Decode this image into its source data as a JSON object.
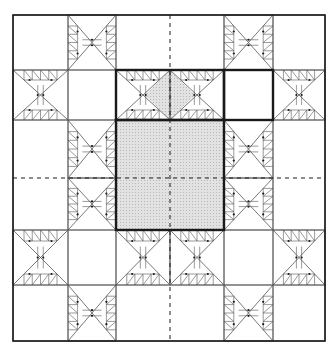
{
  "diagram": {
    "type": "quilt-block-layout",
    "colors": {
      "background": "#ffffff",
      "line": "#1a1a1a",
      "thin_line": "#555555",
      "shade": "#dcdcdc",
      "shade_dot": "#b8b8b8"
    },
    "outer_border": {
      "x0": 13,
      "y0": 15,
      "x1": 325,
      "y1": 341
    },
    "columns": [
      13,
      68,
      116,
      224,
      273,
      325
    ],
    "rows": [
      15,
      70,
      120,
      230,
      285,
      341
    ],
    "center_lines": {
      "x": 170,
      "y": 178,
      "style": "dashed"
    },
    "highlighted_regions": [
      {
        "name": "center-shaded-square",
        "x0": 116,
        "y0": 120,
        "x1": 224,
        "y1": 230,
        "shaded": true,
        "outline": "thick"
      },
      {
        "name": "top-feather-strip",
        "x0": 116,
        "y0": 70,
        "x1": 224,
        "y1": 120,
        "shaded_diamond": true,
        "outline": "thick"
      },
      {
        "name": "plain-center-square",
        "x0": 224,
        "y0": 70,
        "x1": 273,
        "y1": 120,
        "shaded": false,
        "outline": "thick"
      }
    ],
    "feather_units": [
      {
        "orient": "v",
        "x0": 68,
        "y0": 15,
        "x1": 116,
        "y1": 70
      },
      {
        "orient": "v",
        "x0": 224,
        "y0": 15,
        "x1": 273,
        "y1": 70
      },
      {
        "orient": "h",
        "x0": 13,
        "y0": 70,
        "x1": 68,
        "y1": 120
      },
      {
        "orient": "h",
        "x0": 116,
        "y0": 70,
        "x1": 170,
        "y1": 120
      },
      {
        "orient": "h",
        "x0": 170,
        "y0": 70,
        "x1": 224,
        "y1": 120
      },
      {
        "orient": "h",
        "x0": 273,
        "y0": 70,
        "x1": 325,
        "y1": 120
      },
      {
        "orient": "v",
        "x0": 68,
        "y0": 120,
        "x1": 116,
        "y1": 178
      },
      {
        "orient": "v",
        "x0": 68,
        "y0": 178,
        "x1": 116,
        "y1": 230
      },
      {
        "orient": "v",
        "x0": 224,
        "y0": 120,
        "x1": 273,
        "y1": 178
      },
      {
        "orient": "v",
        "x0": 224,
        "y0": 178,
        "x1": 273,
        "y1": 230
      },
      {
        "orient": "h",
        "x0": 13,
        "y0": 230,
        "x1": 68,
        "y1": 285
      },
      {
        "orient": "h",
        "x0": 116,
        "y0": 230,
        "x1": 170,
        "y1": 285
      },
      {
        "orient": "h",
        "x0": 170,
        "y0": 230,
        "x1": 224,
        "y1": 285
      },
      {
        "orient": "h",
        "x0": 273,
        "y0": 230,
        "x1": 325,
        "y1": 285
      },
      {
        "orient": "v",
        "x0": 68,
        "y0": 285,
        "x1": 116,
        "y1": 341
      },
      {
        "orient": "v",
        "x0": 224,
        "y0": 285,
        "x1": 273,
        "y1": 341
      }
    ]
  }
}
